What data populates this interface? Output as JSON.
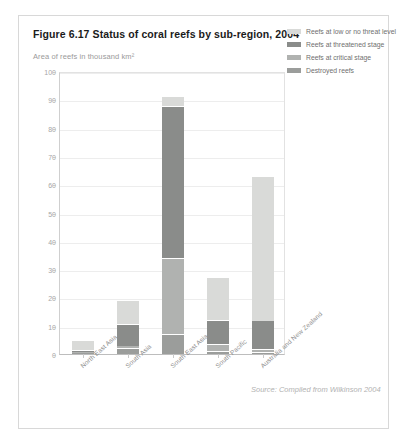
{
  "figure": {
    "title": "Figure 6.17 Status of coral reefs by sub-region, 2004",
    "axis_note": "Area of reefs in thousand km²",
    "source": "Source: Compiled from Wilkinson 2004"
  },
  "legend": {
    "items": [
      {
        "label": "Reefs at low or no threat level",
        "color": "#d9dad8"
      },
      {
        "label": "Reefs at threatened stage",
        "color": "#8a8c8a"
      },
      {
        "label": "Reefs at critical stage",
        "color": "#b0b2b0"
      },
      {
        "label": "Destroyed reefs",
        "color": "#9b9d9b"
      }
    ]
  },
  "chart_data": {
    "type": "bar",
    "title": "Figure 6.17 Status of coral reefs by sub-region, 2004",
    "subtitle": "Area of reefs in thousand km²",
    "xlabel": "",
    "ylabel": "Area of reefs in thousand km²",
    "ylim": [
      0,
      100
    ],
    "ytick_step": 10,
    "yticks": [
      0,
      10,
      20,
      30,
      40,
      50,
      60,
      70,
      80,
      90,
      100
    ],
    "grid": true,
    "stacked": true,
    "legend_position": "top-right",
    "categories": [
      "North East Asia",
      "South Asia",
      "South East Asia",
      "South Pacific",
      "Australia and New Zealand"
    ],
    "series": [
      {
        "name": "Destroyed reefs",
        "color": "#9b9d9b",
        "values": [
          0.4,
          2.0,
          7.0,
          1.0,
          0.8
        ]
      },
      {
        "name": "Reefs at critical stage",
        "color": "#b0b2b0",
        "values": [
          0.3,
          1.0,
          27.0,
          2.5,
          1.0
        ]
      },
      {
        "name": "Reefs at threatened stage",
        "color": "#8a8c8a",
        "values": [
          0.6,
          7.5,
          53.5,
          8.5,
          10.0
        ]
      },
      {
        "name": "Reefs at low or no threat level",
        "color": "#d9dad8",
        "values": [
          3.7,
          8.5,
          3.5,
          15.0,
          51.2
        ]
      }
    ],
    "totals": [
      5.0,
      19.0,
      91.0,
      27.0,
      63.0
    ],
    "units": "thousand km²",
    "year": 2004,
    "source": "Compiled from Wilkinson 2004"
  }
}
